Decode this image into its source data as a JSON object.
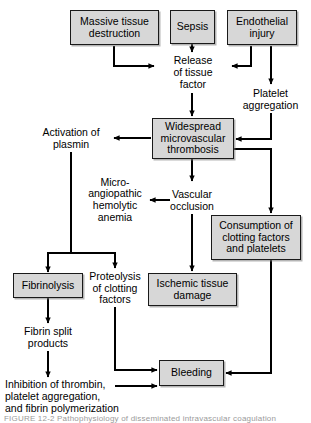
{
  "diagram": {
    "title": "Pathophysiology of disseminated intravascular coagulation",
    "colors": {
      "box_fill": "#d7d7d7",
      "box_border": "#1a1a1a",
      "text": "#000000",
      "edge": "#000000",
      "background": "#ffffff"
    },
    "nodes": [
      {
        "id": "massive_tissue_destruction",
        "label": "Massive tissue\ndestruction",
        "boxed": true
      },
      {
        "id": "sepsis",
        "label": "Sepsis",
        "boxed": true
      },
      {
        "id": "endothelial_injury",
        "label": "Endothelial\ninjury",
        "boxed": true
      },
      {
        "id": "release_of_tissue_factor",
        "label": "Release\nof tissue\nfactor",
        "boxed": false
      },
      {
        "id": "platelet_aggregation",
        "label": "Platelet\naggregation",
        "boxed": false
      },
      {
        "id": "widespread_microvascular_thrombosis",
        "label": "Widespread\nmicrovascular\nthrombosis",
        "boxed": true
      },
      {
        "id": "activation_of_plasmin",
        "label": "Activation of\nplasmin",
        "boxed": false
      },
      {
        "id": "microangiopathic_hemolytic_anemia",
        "label": "Micro-\nangiopathic\nhemolytic\nanemia",
        "boxed": false
      },
      {
        "id": "vascular_occlusion",
        "label": "Vascular\nocclusion",
        "boxed": false
      },
      {
        "id": "consumption_of_clotting_factors",
        "label": "Consumption of\nclotting factors\nand platelets",
        "boxed": true
      },
      {
        "id": "fibrinolysis",
        "label": "Fibrinolysis",
        "boxed": true
      },
      {
        "id": "proteolysis_of_clotting_factors",
        "label": "Proteolysis\nof clotting\nfactors",
        "boxed": false
      },
      {
        "id": "ischemic_tissue_damage",
        "label": "Ischemic tissue\ndamage",
        "boxed": true
      },
      {
        "id": "fibrin_split_products",
        "label": "Fibrin split\nproducts",
        "boxed": false
      },
      {
        "id": "bleeding",
        "label": "Bleeding",
        "boxed": true
      },
      {
        "id": "inhibition_of_thrombin",
        "label": "Inhibition of thrombin,\nplatelet aggregation,\nand fibrin polymerization",
        "boxed": false
      }
    ],
    "edges": [
      {
        "from": "massive_tissue_destruction",
        "to": "release_of_tissue_factor"
      },
      {
        "from": "sepsis",
        "to": "release_of_tissue_factor"
      },
      {
        "from": "endothelial_injury",
        "to": "release_of_tissue_factor"
      },
      {
        "from": "endothelial_injury",
        "to": "platelet_aggregation"
      },
      {
        "from": "release_of_tissue_factor",
        "to": "widespread_microvascular_thrombosis"
      },
      {
        "from": "platelet_aggregation",
        "to": "widespread_microvascular_thrombosis"
      },
      {
        "from": "widespread_microvascular_thrombosis",
        "to": "activation_of_plasmin"
      },
      {
        "from": "widespread_microvascular_thrombosis",
        "to": "vascular_occlusion"
      },
      {
        "from": "widespread_microvascular_thrombosis",
        "to": "consumption_of_clotting_factors"
      },
      {
        "from": "vascular_occlusion",
        "to": "microangiopathic_hemolytic_anemia"
      },
      {
        "from": "vascular_occlusion",
        "to": "ischemic_tissue_damage"
      },
      {
        "from": "activation_of_plasmin",
        "to": "fibrinolysis"
      },
      {
        "from": "activation_of_plasmin",
        "to": "proteolysis_of_clotting_factors"
      },
      {
        "from": "fibrinolysis",
        "to": "fibrin_split_products"
      },
      {
        "from": "fibrin_split_products",
        "to": "inhibition_of_thrombin"
      },
      {
        "from": "proteolysis_of_clotting_factors",
        "to": "bleeding"
      },
      {
        "from": "inhibition_of_thrombin",
        "to": "bleeding"
      },
      {
        "from": "consumption_of_clotting_factors",
        "to": "bleeding"
      }
    ],
    "caption": "FIGURE 12-2   Pathophysiology of disseminated intravascular coagulation"
  }
}
